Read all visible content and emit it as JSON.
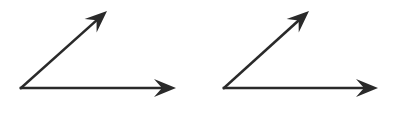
{
  "diagram": {
    "type": "angles",
    "stroke_color": "#2a2a2a",
    "background": "#ffffff",
    "angles": [
      {
        "name": "left-angle",
        "vertex": [
          21,
          88
        ],
        "rays": [
          {
            "name": "upper-ray",
            "to": [
              107,
              11
            ]
          },
          {
            "name": "horizontal-ray",
            "to": [
              176,
              88
            ]
          }
        ]
      },
      {
        "name": "right-angle",
        "vertex": [
          224,
          88
        ],
        "rays": [
          {
            "name": "upper-ray",
            "to": [
              309,
              11
            ]
          },
          {
            "name": "horizontal-ray",
            "to": [
              378,
              88
            ]
          }
        ]
      }
    ]
  }
}
